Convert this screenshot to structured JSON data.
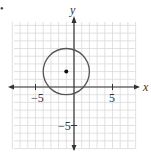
{
  "chart_data": {
    "type": "scatter",
    "title": "",
    "xlabel": "x",
    "ylabel": "y",
    "xlim": [
      -7,
      7
    ],
    "ylim": [
      -8,
      8
    ],
    "grid": true,
    "x_ticks": [
      {
        "value": -5,
        "label": "−5"
      },
      {
        "value": 5,
        "label": "5"
      }
    ],
    "y_ticks": [
      {
        "value": -5,
        "label": "−5"
      }
    ],
    "shapes": [
      {
        "type": "circle",
        "center": [
          -1,
          2
        ],
        "radius": 3
      }
    ],
    "points": [
      {
        "x": -1,
        "y": 2,
        "label": "center"
      }
    ]
  },
  "colors": {
    "grid": "#d9d9d9",
    "axis": "#333333",
    "circle": "#555555",
    "point": "#111111"
  },
  "labels": {
    "x_axis": "x",
    "y_axis": "y",
    "tick_x_neg5": "−5",
    "tick_x_pos5": "5",
    "tick_y_neg5": "−5",
    "bullet": "•"
  }
}
